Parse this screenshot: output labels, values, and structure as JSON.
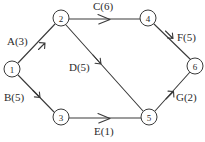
{
  "diagram": {
    "stroke_color": "#3a3a3a",
    "text_color": "#2b2b2b",
    "background_color": "#ffffff",
    "nodes": [
      {
        "id": "n1",
        "label": "1",
        "x": 12,
        "y": 69,
        "r": 8
      },
      {
        "id": "n2",
        "label": "2",
        "x": 61,
        "y": 18,
        "r": 8
      },
      {
        "id": "n3",
        "label": "3",
        "x": 61,
        "y": 117,
        "r": 8
      },
      {
        "id": "n4",
        "label": "4",
        "x": 148,
        "y": 18,
        "r": 8
      },
      {
        "id": "n5",
        "label": "5",
        "x": 149,
        "y": 117,
        "r": 8
      },
      {
        "id": "n6",
        "label": "6",
        "x": 195,
        "y": 66,
        "r": 8
      }
    ],
    "edges": [
      {
        "id": "e_a",
        "label": "A(3)",
        "from": "n1",
        "to": "n2",
        "weight": 3,
        "label_x": 7,
        "label_y": 36
      },
      {
        "id": "e_b",
        "label": "B(5)",
        "from": "n1",
        "to": "n3",
        "weight": 5,
        "label_x": 4,
        "label_y": 92
      },
      {
        "id": "e_c",
        "label": "C(6)",
        "from": "n2",
        "to": "n4",
        "weight": 6,
        "label_x": 93,
        "label_y": 1
      },
      {
        "id": "e_d",
        "label": "D(5)",
        "from": "n2",
        "to": "n5",
        "weight": 5,
        "label_x": 69,
        "label_y": 62
      },
      {
        "id": "e_e",
        "label": "E(1)",
        "from": "n3",
        "to": "n5",
        "weight": 1,
        "label_x": 94,
        "label_y": 126
      },
      {
        "id": "e_f",
        "label": "F(5)",
        "from": "n4",
        "to": "n6",
        "weight": 5,
        "label_x": 177,
        "label_y": 32
      },
      {
        "id": "e_g",
        "label": "G(2)",
        "from": "n5",
        "to": "n6",
        "weight": 2,
        "label_x": 176,
        "label_y": 92
      }
    ]
  }
}
